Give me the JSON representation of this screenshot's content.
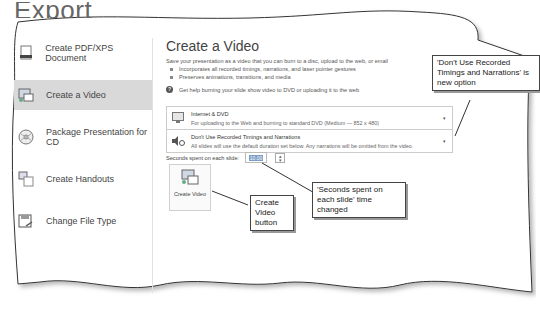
{
  "page": {
    "title": "Export"
  },
  "sidebar": {
    "items": [
      {
        "label": "Create PDF/XPS Document",
        "icon": "pdf-document-icon",
        "active": false
      },
      {
        "label": "Create a Video",
        "icon": "video-icon",
        "active": true
      },
      {
        "label": "Package Presentation for CD",
        "icon": "cd-icon",
        "active": false
      },
      {
        "label": "Create Handouts",
        "icon": "handouts-icon",
        "active": false
      },
      {
        "label": "Change File Type",
        "icon": "file-type-icon",
        "active": false
      }
    ]
  },
  "main": {
    "heading": "Create a Video",
    "description": "Save your presentation as a video that you can burn to a disc, upload to the web, or email",
    "bullets": [
      "Incorporates all recorded timings, narrations, and laser pointer gestures",
      "Preserves animations, transitions, and media"
    ],
    "help_link": "Get help burning your slide show video to DVD or uploading it to the web",
    "quality_dropdown": {
      "title": "Internet & DVD",
      "subtitle": "For uploading to the Web and burning to standard DVD  (Medium — 852 x 480)"
    },
    "timings_dropdown": {
      "title": "Don't Use Recorded Timings and Narrations",
      "subtitle": "All slides will use the default duration set below. Any narrations will be omitted from the video."
    },
    "seconds_label": "Seconds spent on each slide:",
    "seconds_value": "10.00",
    "create_video_button": "Create Video"
  },
  "callouts": {
    "timings": "'Don't Use Recorded Timings and Narrations' is new option",
    "seconds": "'Seconds spent on each slide' time changed",
    "button": "Create Video button"
  }
}
